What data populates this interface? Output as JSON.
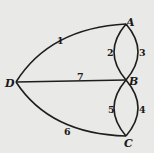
{
  "diagram": {
    "type": "multigraph",
    "nodes": [
      {
        "id": "A",
        "label": "A"
      },
      {
        "id": "B",
        "label": "B"
      },
      {
        "id": "C",
        "label": "C"
      },
      {
        "id": "D",
        "label": "D"
      }
    ],
    "edges": [
      {
        "id": "1",
        "label": "1",
        "from": "D",
        "to": "A"
      },
      {
        "id": "2",
        "label": "2",
        "from": "A",
        "to": "B"
      },
      {
        "id": "3",
        "label": "3",
        "from": "A",
        "to": "B"
      },
      {
        "id": "4",
        "label": "4",
        "from": "B",
        "to": "C"
      },
      {
        "id": "5",
        "label": "5",
        "from": "B",
        "to": "C"
      },
      {
        "id": "6",
        "label": "6",
        "from": "D",
        "to": "C"
      },
      {
        "id": "7",
        "label": "7",
        "from": "D",
        "to": "B"
      }
    ]
  }
}
